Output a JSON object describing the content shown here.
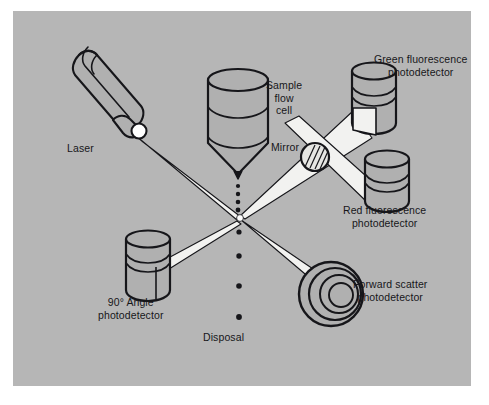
{
  "figure": {
    "background_color": "#ffffff",
    "panel_color": "#b6b6b6",
    "ink_color": "#16161a",
    "beam_color": "#f2f2f0",
    "component_fill": "#b0b0b0"
  },
  "labels": {
    "laser": "Laser",
    "sample_flow_cell": "Sample\nflow\ncell",
    "mirror": "Mirror",
    "green_fluorescence": "Green fluorescence\nphotodetector",
    "red_fluorescence": "Red fluorescence\nphotodetector",
    "forward_scatter": "Forward scatter\nphotodetector",
    "ninety_degree": "90° Angle\nphotodetector",
    "disposal": "Disposal"
  },
  "components": [
    {
      "id": "laser",
      "name": "laser-source",
      "label": "Laser"
    },
    {
      "id": "sample-flow-cell",
      "name": "sample-flow-cell",
      "label": "Sample flow cell"
    },
    {
      "id": "mirror",
      "name": "mirror",
      "label": "Mirror"
    },
    {
      "id": "green-detector",
      "name": "green-fluorescence-detector",
      "label": "Green fluorescence photodetector"
    },
    {
      "id": "red-detector",
      "name": "red-fluorescence-detector",
      "label": "Red fluorescence photodetector"
    },
    {
      "id": "forward-detector",
      "name": "forward-scatter-detector",
      "label": "Forward scatter photodetector"
    },
    {
      "id": "ninety-detector",
      "name": "ninety-angle-detector",
      "label": "90° Angle photodetector"
    },
    {
      "id": "cell-stream",
      "name": "cell-stream",
      "label": "Disposal"
    }
  ],
  "beams": [
    {
      "id": "laser-beam",
      "from": "laser",
      "to": "interrogation-point"
    },
    {
      "id": "forward-beam",
      "from": "interrogation-point",
      "to": "forward-scatter-detector"
    },
    {
      "id": "ninety-beam",
      "from": "interrogation-point",
      "to": "ninety-angle-detector"
    },
    {
      "id": "green-beam",
      "from": "interrogation-point",
      "to": "green-fluorescence-detector"
    },
    {
      "id": "red-beam",
      "from": "interrogation-point",
      "to": "red-fluorescence-detector"
    }
  ]
}
